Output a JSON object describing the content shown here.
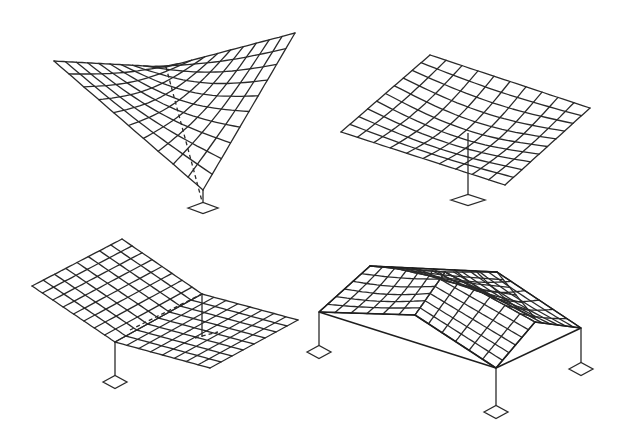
{
  "figure": {
    "colors": {
      "line": "#2a2a2a",
      "background": "#ffffff"
    }
  },
  "diagrams": [
    {
      "id": "inverted-umbrella-single-column",
      "grid_divisions": [
        10,
        10
      ],
      "surfaces": [
        {
          "corners": [
            [
              54,
              61
            ],
            [
              166,
              67
            ],
            [
              295,
              33
            ],
            [
              203,
              190
            ]
          ],
          "sag": [
            [
              0,
              0
            ],
            [
              0,
              0
            ]
          ],
          "u": 10,
          "v": 10,
          "order": "a-b-c-d",
          "mid_dip": 12
        }
      ],
      "dashed": [
        [
          [
            166,
            67
          ],
          [
            203,
            205
          ]
        ]
      ],
      "columns": [
        [
          [
            203,
            190
          ],
          [
            203,
            204
          ]
        ]
      ],
      "footings": [
        {
          "cx": 203,
          "cy": 208,
          "w": 30,
          "h": 11
        }
      ]
    },
    {
      "id": "flat-hypar-single-column",
      "surfaces": [
        {
          "corners": [
            [
              341,
              132
            ],
            [
              430,
              55
            ],
            [
              590,
              108
            ],
            [
              505,
              185
            ]
          ],
          "u": 10,
          "v": 10,
          "mid_dip": 10
        }
      ],
      "dashed": [],
      "columns": [
        [
          [
            468,
            133
          ],
          [
            468,
            196
          ]
        ]
      ],
      "footings": [
        {
          "cx": 468,
          "cy": 200,
          "w": 34,
          "h": 11
        }
      ]
    },
    {
      "id": "folded-hypar-corner-column",
      "surfaces": [
        {
          "corners": [
            [
              32,
              286
            ],
            [
              122,
              239
            ],
            [
              202,
              294
            ],
            [
              115,
              342
            ]
          ],
          "u": 8,
          "v": 8,
          "mid_dip": 0
        },
        {
          "corners": [
            [
              115,
              342
            ],
            [
              202,
              294
            ],
            [
              298,
              320
            ],
            [
              210,
              368
            ]
          ],
          "u": 8,
          "v": 8,
          "mid_dip": 0
        }
      ],
      "dashed": [
        [
          [
            130,
            330
          ],
          [
            202,
            294
          ]
        ],
        [
          [
            195,
            338
          ],
          [
            218,
            332
          ]
        ]
      ],
      "columns": [
        [
          [
            115,
            342
          ],
          [
            115,
            378
          ]
        ],
        [
          [
            202,
            294
          ],
          [
            202,
            337
          ]
        ]
      ],
      "footings": [
        {
          "cx": 115,
          "cy": 382,
          "w": 24,
          "h": 13
        }
      ]
    },
    {
      "id": "four-column-hypar-roof",
      "surfaces": [
        {
          "corners": [
            [
              319,
              312
            ],
            [
              370,
              266
            ],
            [
              445,
              272
            ],
            [
              415,
              315
            ]
          ],
          "u": 6,
          "v": 6,
          "mid_dip": 3
        },
        {
          "corners": [
            [
              370,
              266
            ],
            [
              497,
              272
            ],
            [
              535,
              318
            ],
            [
              445,
              272
            ]
          ],
          "u": 6,
          "v": 6,
          "mid_dip": 3,
          "skip": true
        },
        {
          "corners": [
            [
              445,
              272
            ],
            [
              497,
              272
            ],
            [
              581,
              328
            ],
            [
              535,
              322
            ]
          ],
          "u": 6,
          "v": 6,
          "mid_dip": 3
        },
        {
          "corners": [
            [
              415,
              315
            ],
            [
              445,
              272
            ],
            [
              535,
              322
            ],
            [
              496,
              368
            ]
          ],
          "u": 6,
          "v": 6,
          "mid_dip": 0
        }
      ],
      "edges": [
        [
          [
            319,
            312
          ],
          [
            370,
            266
          ]
        ],
        [
          [
            370,
            266
          ],
          [
            497,
            272
          ]
        ],
        [
          [
            497,
            272
          ],
          [
            581,
            328
          ]
        ],
        [
          [
            319,
            312
          ],
          [
            496,
            368
          ]
        ],
        [
          [
            496,
            368
          ],
          [
            581,
            328
          ]
        ],
        [
          [
            319,
            312
          ],
          [
            415,
            315
          ]
        ],
        [
          [
            535,
            322
          ],
          [
            581,
            328
          ]
        ],
        [
          [
            415,
            315
          ],
          [
            496,
            368
          ]
        ],
        [
          [
            535,
            322
          ],
          [
            496,
            368
          ]
        ]
      ],
      "dashed": [],
      "columns": [
        [
          [
            319,
            312
          ],
          [
            319,
            348
          ]
        ],
        [
          [
            496,
            368
          ],
          [
            496,
            408
          ]
        ],
        [
          [
            581,
            328
          ],
          [
            581,
            365
          ]
        ]
      ],
      "footings": [
        {
          "cx": 319,
          "cy": 352,
          "w": 24,
          "h": 13
        },
        {
          "cx": 496,
          "cy": 412,
          "w": 24,
          "h": 13
        },
        {
          "cx": 581,
          "cy": 369,
          "w": 24,
          "h": 13
        }
      ]
    }
  ]
}
